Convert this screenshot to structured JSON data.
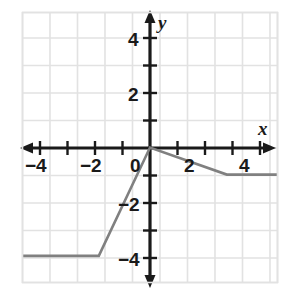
{
  "chart_data": {
    "type": "line",
    "title": "",
    "xlabel": "x",
    "ylabel": "y",
    "xlim": [
      -5,
      5
    ],
    "ylim": [
      -5,
      5
    ],
    "grid": true,
    "legend": false,
    "x_ticks": [
      -4,
      -2,
      0,
      2,
      4
    ],
    "x_tick_labels": [
      "−4",
      "−2",
      "0",
      "2",
      "4"
    ],
    "y_ticks": [
      2,
      4
    ],
    "y_tick_labels": [
      "2",
      "4"
    ],
    "y_negative_ticks": [
      -2,
      -4
    ],
    "y_negative_tick_labels": [
      "−2",
      "−4"
    ],
    "series": [
      {
        "name": "piecewise-function",
        "color": "#808080",
        "points": [
          {
            "x": -5,
            "y": -4
          },
          {
            "x": -2,
            "y": -4
          },
          {
            "x": 0,
            "y": 0
          },
          {
            "x": 3,
            "y": -1
          },
          {
            "x": 5,
            "y": -1
          }
        ],
        "segments": [
          {
            "from": [
              -5,
              -4
            ],
            "to": [
              -2,
              -4
            ],
            "slope": 0
          },
          {
            "from": [
              -2,
              -4
            ],
            "to": [
              0,
              0
            ],
            "slope": 2
          },
          {
            "from": [
              0,
              0
            ],
            "to": [
              3,
              -1
            ],
            "slope": -0.3333
          },
          {
            "from": [
              3,
              -1
            ],
            "to": [
              5,
              -1
            ],
            "slope": 0
          }
        ]
      }
    ]
  },
  "axes": {
    "x_label": "x",
    "y_label": "y",
    "x_arrow_left": "arrow-left",
    "x_arrow_right": "arrow-right",
    "y_arrow_up": "arrow-up",
    "y_arrow_down": "arrow-down",
    "axis_color": "#1a1a1a",
    "grid_color": "#e2e2e2",
    "line_color": "#808080",
    "background": "#ffffff"
  },
  "labels": {
    "x_neg4": "−4",
    "x_neg2": "−2",
    "origin": "0",
    "x_pos2": "2",
    "x_pos4": "4",
    "y_pos2": "2",
    "y_pos4": "4",
    "y_neg2": "−2",
    "y_neg4": "−4"
  }
}
